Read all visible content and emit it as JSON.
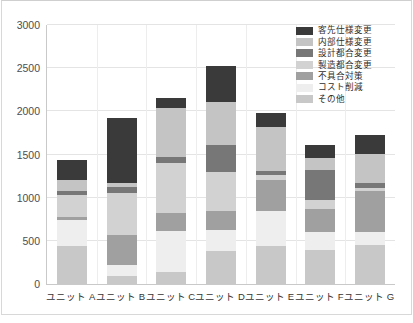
{
  "chart_data": {
    "type": "bar",
    "stacked": true,
    "title": "",
    "xlabel": "",
    "ylabel": "",
    "ylim": [
      0,
      3000
    ],
    "yticks": [
      0,
      500,
      1000,
      1500,
      2000,
      2500,
      3000
    ],
    "grid": true,
    "legend_position": "top-right",
    "categories": [
      "ユニット A",
      "ユニット B",
      "ユニット C",
      "ユニット D",
      "ユニット E",
      "ユニット F",
      "ユニット G"
    ],
    "series": [
      {
        "name": "その他",
        "color": "#c8c8c8",
        "values": [
          435,
          95,
          140,
          385,
          440,
          395,
          455
        ]
      },
      {
        "name": "コスト削減",
        "color": "#eeeeee",
        "values": [
          310,
          130,
          470,
          235,
          400,
          205,
          150
        ]
      },
      {
        "name": "不具合対策",
        "color": "#a0a0a0",
        "values": [
          35,
          345,
          215,
          230,
          370,
          270,
          470
        ]
      },
      {
        "name": "製造都合変更",
        "color": "#d2d2d2",
        "values": [
          250,
          480,
          575,
          450,
          55,
          100,
          40
        ]
      },
      {
        "name": "設計都合変更",
        "color": "#777777",
        "values": [
          50,
          70,
          75,
          305,
          45,
          345,
          55
        ]
      },
      {
        "name": "内部仕様変更",
        "color": "#c4c4c4",
        "values": [
          125,
          50,
          565,
          500,
          505,
          145,
          340
        ]
      },
      {
        "name": "客先仕様変更",
        "color": "#3a3a3a",
        "values": [
          235,
          750,
          110,
          415,
          165,
          145,
          215
        ]
      }
    ],
    "totals": [
      1440,
      1920,
      2150,
      2520,
      1980,
      1605,
      2025
    ]
  },
  "legend": {
    "entries": [
      {
        "label": "客先仕様変更",
        "color": "#3a3a3a"
      },
      {
        "label": "内部仕様変更",
        "color": "#c4c4c4"
      },
      {
        "label": "設計都合変更",
        "color": "#777777"
      },
      {
        "label": "製造都合変更",
        "color": "#d2d2d2"
      },
      {
        "label": "不具合対策",
        "color": "#a0a0a0"
      },
      {
        "label": "コスト削減",
        "color": "#eeeeee"
      },
      {
        "label": "その他",
        "color": "#c8c8c8"
      }
    ]
  },
  "axis": {
    "y_tick_labels": [
      "3000",
      "2500",
      "2000",
      "1500",
      "1000",
      "500",
      "0"
    ],
    "x_tick_labels": [
      "ユニット A",
      "ユニット B",
      "ユニット C",
      "ユニット D",
      "ユニット E",
      "ユニット F",
      "ユニット G"
    ]
  }
}
